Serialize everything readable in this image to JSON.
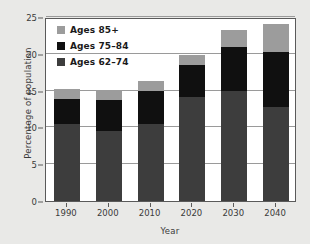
{
  "chart_data": {
    "type": "bar",
    "stacked": true,
    "title": "",
    "xlabel": "Year",
    "ylabel": "Percentage of population",
    "categories": [
      "1990",
      "2000",
      "2010",
      "2020",
      "2030",
      "2040"
    ],
    "series": [
      {
        "name": "Ages 62–74",
        "color": "#3d3d3d",
        "values": [
          10.5,
          9.5,
          10.5,
          14.2,
          15.0,
          12.8
        ]
      },
      {
        "name": "Ages 75–84",
        "color": "#101010",
        "values": [
          3.3,
          4.2,
          4.5,
          4.3,
          5.9,
          7.5
        ]
      },
      {
        "name": "Ages 85+",
        "color": "#9c9c9c",
        "values": [
          1.4,
          1.4,
          1.3,
          1.4,
          2.3,
          3.7
        ]
      }
    ],
    "totals": [
      15.2,
      15.1,
      16.3,
      19.9,
      23.2,
      24.0
    ],
    "ylim": [
      0,
      25
    ],
    "yticks": [
      0,
      5,
      10,
      15,
      20,
      25
    ],
    "grid": "horizontal",
    "legend_position": "top-left",
    "legend_order": [
      "Ages 85+",
      "Ages 75–84",
      "Ages 62–74"
    ]
  }
}
